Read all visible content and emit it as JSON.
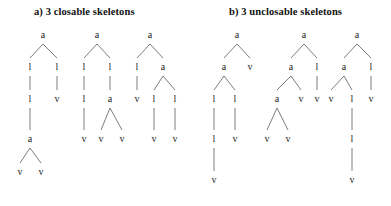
{
  "figure": {
    "background_color": "#ffffff",
    "line_color": "#6d6d6d",
    "text_color": "#1c1c1c",
    "width": 391,
    "height": 206
  },
  "panels": [
    {
      "id": "panel-a",
      "title": "a) 3 closable skeletons",
      "title_x": 34,
      "title_y": 6,
      "trees": [
        {
          "id": "tree-a1",
          "nodes": [
            {
              "id": "a1-n0",
              "label": "a",
              "x": 43,
              "y": 35
            },
            {
              "id": "a1-n1",
              "label": "l",
              "x": 30,
              "y": 67
            },
            {
              "id": "a1-n2",
              "label": "l",
              "x": 57,
              "y": 67
            },
            {
              "id": "a1-n3",
              "label": "l",
              "x": 30,
              "y": 99
            },
            {
              "id": "a1-n4",
              "label": "v",
              "x": 57,
              "y": 99
            },
            {
              "id": "a1-n5",
              "label": "a",
              "x": 30,
              "y": 139
            },
            {
              "id": "a1-n6",
              "label": "v",
              "x": 20,
              "y": 172
            },
            {
              "id": "a1-n7",
              "label": "v",
              "x": 41,
              "y": 172
            }
          ],
          "edges": [
            [
              "a1-n0",
              "a1-n1"
            ],
            [
              "a1-n0",
              "a1-n2"
            ],
            [
              "a1-n1",
              "a1-n3"
            ],
            [
              "a1-n2",
              "a1-n4"
            ],
            [
              "a1-n3",
              "a1-n5"
            ],
            [
              "a1-n5",
              "a1-n6"
            ],
            [
              "a1-n5",
              "a1-n7"
            ]
          ]
        },
        {
          "id": "tree-a2",
          "nodes": [
            {
              "id": "a2-n0",
              "label": "a",
              "x": 97,
              "y": 35
            },
            {
              "id": "a2-n1",
              "label": "l",
              "x": 84,
              "y": 67
            },
            {
              "id": "a2-n2",
              "label": "l",
              "x": 110,
              "y": 67
            },
            {
              "id": "a2-n3",
              "label": "l",
              "x": 84,
              "y": 99
            },
            {
              "id": "a2-n4",
              "label": "a",
              "x": 110,
              "y": 99
            },
            {
              "id": "a2-n5",
              "label": "v",
              "x": 84,
              "y": 139
            },
            {
              "id": "a2-n6",
              "label": "v",
              "x": 101,
              "y": 139
            },
            {
              "id": "a2-n7",
              "label": "v",
              "x": 122,
              "y": 139
            }
          ],
          "edges": [
            [
              "a2-n0",
              "a2-n1"
            ],
            [
              "a2-n0",
              "a2-n2"
            ],
            [
              "a2-n1",
              "a2-n3"
            ],
            [
              "a2-n2",
              "a2-n4"
            ],
            [
              "a2-n3",
              "a2-n5"
            ],
            [
              "a2-n4",
              "a2-n6"
            ],
            [
              "a2-n4",
              "a2-n7"
            ]
          ]
        },
        {
          "id": "tree-a3",
          "nodes": [
            {
              "id": "a3-n0",
              "label": "a",
              "x": 150,
              "y": 35
            },
            {
              "id": "a3-n1",
              "label": "l",
              "x": 137,
              "y": 67
            },
            {
              "id": "a3-n2",
              "label": "a",
              "x": 163,
              "y": 67
            },
            {
              "id": "a3-n3",
              "label": "v",
              "x": 137,
              "y": 99
            },
            {
              "id": "a3-n4",
              "label": "l",
              "x": 154,
              "y": 99
            },
            {
              "id": "a3-n5",
              "label": "l",
              "x": 175,
              "y": 99
            },
            {
              "id": "a3-n6",
              "label": "v",
              "x": 154,
              "y": 139
            },
            {
              "id": "a3-n7",
              "label": "v",
              "x": 175,
              "y": 139
            }
          ],
          "edges": [
            [
              "a3-n0",
              "a3-n1"
            ],
            [
              "a3-n0",
              "a3-n2"
            ],
            [
              "a3-n1",
              "a3-n3"
            ],
            [
              "a3-n2",
              "a3-n4"
            ],
            [
              "a3-n2",
              "a3-n5"
            ],
            [
              "a3-n4",
              "a3-n6"
            ],
            [
              "a3-n5",
              "a3-n7"
            ]
          ]
        }
      ]
    },
    {
      "id": "panel-b",
      "title": "b) 3 unclosable skeletons",
      "title_x": 229,
      "title_y": 6,
      "trees": [
        {
          "id": "tree-b1",
          "nodes": [
            {
              "id": "b1-n0",
              "label": "a",
              "x": 237,
              "y": 35
            },
            {
              "id": "b1-n1",
              "label": "a",
              "x": 224,
              "y": 67
            },
            {
              "id": "b1-n2",
              "label": "v",
              "x": 250,
              "y": 67
            },
            {
              "id": "b1-n3",
              "label": "l",
              "x": 214,
              "y": 99
            },
            {
              "id": "b1-n4",
              "label": "l",
              "x": 235,
              "y": 99
            },
            {
              "id": "b1-n5",
              "label": "l",
              "x": 214,
              "y": 139
            },
            {
              "id": "b1-n6",
              "label": "v",
              "x": 235,
              "y": 139
            },
            {
              "id": "b1-n7",
              "label": "v",
              "x": 214,
              "y": 180
            }
          ],
          "edges": [
            [
              "b1-n0",
              "b1-n1"
            ],
            [
              "b1-n0",
              "b1-n2"
            ],
            [
              "b1-n1",
              "b1-n3"
            ],
            [
              "b1-n1",
              "b1-n4"
            ],
            [
              "b1-n3",
              "b1-n5"
            ],
            [
              "b1-n4",
              "b1-n6"
            ],
            [
              "b1-n5",
              "b1-n7"
            ]
          ]
        },
        {
          "id": "tree-b2",
          "nodes": [
            {
              "id": "b2-n0",
              "label": "a",
              "x": 304,
              "y": 35
            },
            {
              "id": "b2-n1",
              "label": "a",
              "x": 291,
              "y": 67
            },
            {
              "id": "b2-n2",
              "label": "l",
              "x": 317,
              "y": 67
            },
            {
              "id": "b2-n3",
              "label": "a",
              "x": 277,
              "y": 99
            },
            {
              "id": "b2-n4",
              "label": "v",
              "x": 301,
              "y": 99
            },
            {
              "id": "b2-n5",
              "label": "v",
              "x": 317,
              "y": 99
            },
            {
              "id": "b2-n6",
              "label": "v",
              "x": 267,
              "y": 139
            },
            {
              "id": "b2-n7",
              "label": "v",
              "x": 288,
              "y": 139
            }
          ],
          "edges": [
            [
              "b2-n0",
              "b2-n1"
            ],
            [
              "b2-n0",
              "b2-n2"
            ],
            [
              "b2-n1",
              "b2-n3"
            ],
            [
              "b2-n1",
              "b2-n4"
            ],
            [
              "b2-n2",
              "b2-n5"
            ],
            [
              "b2-n3",
              "b2-n6"
            ],
            [
              "b2-n3",
              "b2-n7"
            ]
          ]
        },
        {
          "id": "tree-b3",
          "nodes": [
            {
              "id": "b3-n0",
              "label": "a",
              "x": 357,
              "y": 35
            },
            {
              "id": "b3-n1",
              "label": "a",
              "x": 344,
              "y": 67
            },
            {
              "id": "b3-n2",
              "label": "l",
              "x": 371,
              "y": 67
            },
            {
              "id": "b3-n3",
              "label": "v",
              "x": 331,
              "y": 99
            },
            {
              "id": "b3-n4",
              "label": "l",
              "x": 352,
              "y": 99
            },
            {
              "id": "b3-n5",
              "label": "v",
              "x": 371,
              "y": 99
            },
            {
              "id": "b3-n6",
              "label": "l",
              "x": 352,
              "y": 139
            },
            {
              "id": "b3-n7",
              "label": "v",
              "x": 352,
              "y": 180
            }
          ],
          "edges": [
            [
              "b3-n0",
              "b3-n1"
            ],
            [
              "b3-n0",
              "b3-n2"
            ],
            [
              "b3-n1",
              "b3-n3"
            ],
            [
              "b3-n1",
              "b3-n4"
            ],
            [
              "b3-n2",
              "b3-n5"
            ],
            [
              "b3-n4",
              "b3-n6"
            ],
            [
              "b3-n6",
              "b3-n7"
            ]
          ]
        }
      ]
    }
  ]
}
